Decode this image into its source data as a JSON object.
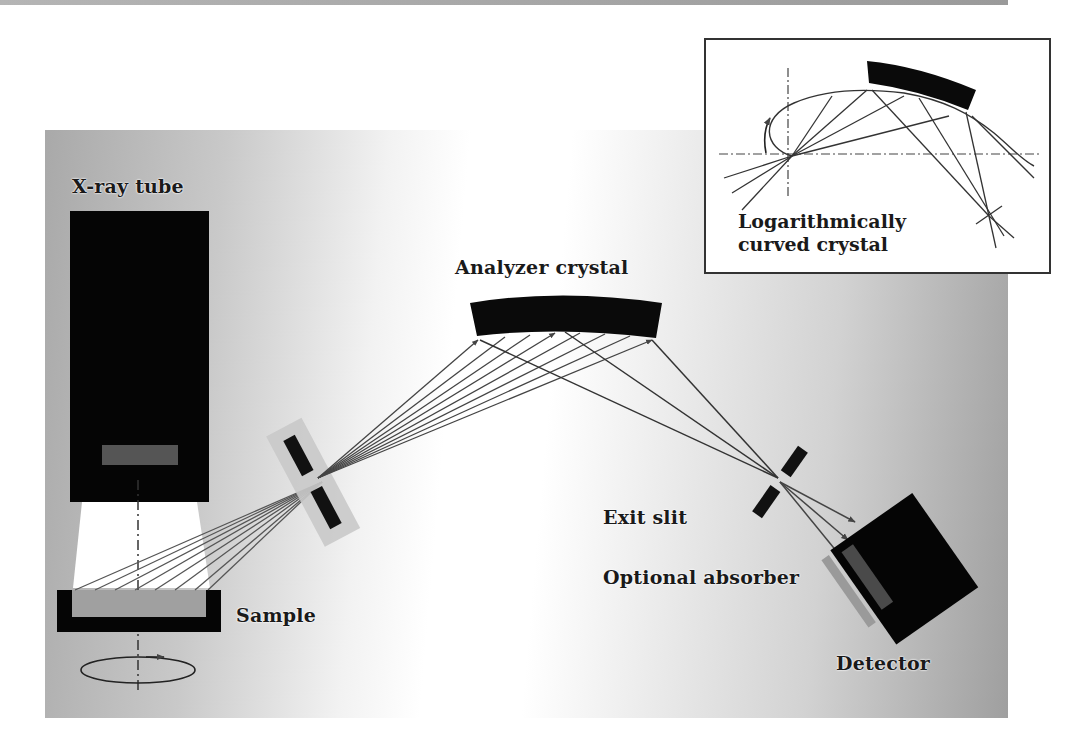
{
  "figure": {
    "type": "schematic"
  },
  "labels": {
    "xray_tube": "X-ray tube",
    "analyzer_crystal": "Analyzer crystal",
    "exit_slit": "Exit slit",
    "optional_absorber": "Optional absorber",
    "sample": "Sample",
    "detector": "Detector"
  },
  "inset": {
    "caption_line1": "Logarithmically",
    "caption_line2": "curved crystal"
  },
  "colors": {
    "component_fill": "#000000",
    "slit_holder": "#c8c8c8",
    "sample_surface": "#a0a0a0",
    "beam": "#3a3a3a",
    "text": "#1a1a1a",
    "inset_border": "#333333"
  }
}
